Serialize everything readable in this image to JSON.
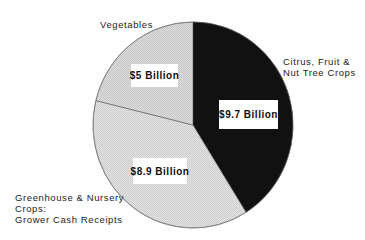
{
  "chart_data": {
    "type": "pie",
    "title": "",
    "categories": [
      "Citrus, Fruit & Nut Tree Crops",
      "Greenhouse & Nursery Crops: Grower Cash Receipts",
      "Vegetables"
    ],
    "values": [
      9.7,
      8.9,
      5.0
    ],
    "unit": "Billion USD",
    "value_labels": [
      "$9.7 Billion",
      "$8.9 Billion",
      "$5 Billion"
    ],
    "start_angle_deg": 0,
    "direction": "clockwise",
    "colors": [
      "#111111",
      "#dadada",
      "#d3d3d3"
    ],
    "legend": "none (external slice labels)"
  },
  "labels": {
    "citrus": {
      "line1": "Citrus, Fruit &",
      "line2": "Nut Tree Crops",
      "value": "$9.7 Billion"
    },
    "greenhouse": {
      "line1": "Greenhouse & Nursery",
      "line2": "Crops:",
      "line3": "Grower Cash Receipts",
      "value": "$8.9 Billion"
    },
    "vegetables": {
      "line1": "Vegetables",
      "value": "$5 Billion"
    }
  }
}
